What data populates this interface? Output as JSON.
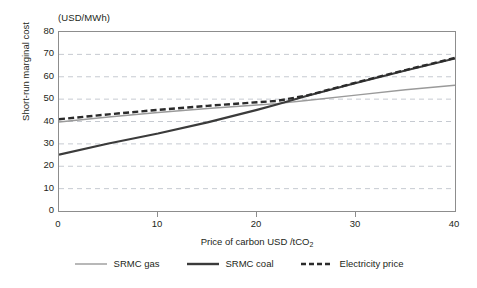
{
  "chart_data": {
    "type": "line",
    "title": "",
    "subtitle": "",
    "unit_caption": "(USD/MWh)",
    "xlabel": "Price of carbon USD /tCO",
    "xlabel_sub": "2",
    "ylabel": "Short-run marginal cost",
    "xlim": [
      0,
      40
    ],
    "ylim": [
      0,
      80
    ],
    "xticks": [
      "0",
      "10",
      "20",
      "30",
      "40"
    ],
    "xtick_values": [
      0,
      10,
      20,
      30,
      40
    ],
    "yticks": [
      "0",
      "10",
      "20",
      "30",
      "40",
      "50",
      "60",
      "70",
      "80"
    ],
    "ytick_values": [
      0,
      10,
      20,
      30,
      40,
      50,
      60,
      70,
      80
    ],
    "grid": "horizontal-dashed",
    "legend_position": "bottom",
    "series": [
      {
        "name": "SRMC gas",
        "style": "solid-thin",
        "color": "#9a9a9a",
        "x": [
          0,
          5,
          10,
          15,
          20,
          22,
          25,
          30,
          35,
          40
        ],
        "values": [
          39.8,
          42.0,
          44.0,
          45.8,
          47.4,
          48.0,
          49.4,
          51.8,
          54.2,
          56.2
        ]
      },
      {
        "name": "SRMC coal",
        "style": "solid-thick",
        "color": "#3b3b3b",
        "x": [
          0,
          5,
          10,
          15,
          20,
          22,
          25,
          30,
          35,
          40
        ],
        "values": [
          25.2,
          30.2,
          34.6,
          39.6,
          45.2,
          47.6,
          51.4,
          57.2,
          62.8,
          68.2
        ]
      },
      {
        "name": "Electricity price",
        "style": "dashed-thick",
        "color": "#2b2b2b",
        "x": [
          0,
          5,
          10,
          15,
          20,
          22,
          25,
          30,
          35,
          40
        ],
        "values": [
          41.0,
          43.2,
          45.2,
          47.0,
          48.6,
          49.2,
          51.6,
          57.4,
          63.0,
          68.4
        ]
      }
    ]
  },
  "legend": {
    "items": [
      {
        "label": "SRMC gas"
      },
      {
        "label": "SRMC coal"
      },
      {
        "label": "Electricity price"
      }
    ]
  }
}
